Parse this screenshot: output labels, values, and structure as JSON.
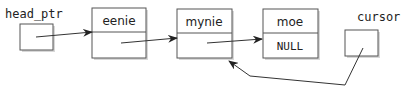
{
  "diagram": {
    "pointers": [
      {
        "id": "head_ptr",
        "label": "head_ptr"
      },
      {
        "id": "cursor",
        "label": "cursor"
      }
    ],
    "nodes": [
      {
        "data": "eenie",
        "link": ""
      },
      {
        "data": "mynie",
        "link": ""
      },
      {
        "data": "moe",
        "link": "NULL"
      }
    ],
    "edges": [
      {
        "from": "head_ptr",
        "to": "eenie"
      },
      {
        "from": "eenie.link",
        "to": "mynie"
      },
      {
        "from": "mynie.link",
        "to": "moe"
      },
      {
        "from": "cursor",
        "to": "mynie"
      }
    ],
    "colors": {
      "stroke": "#555555",
      "text": "#222222",
      "shadow": "#d8d8d8"
    }
  }
}
